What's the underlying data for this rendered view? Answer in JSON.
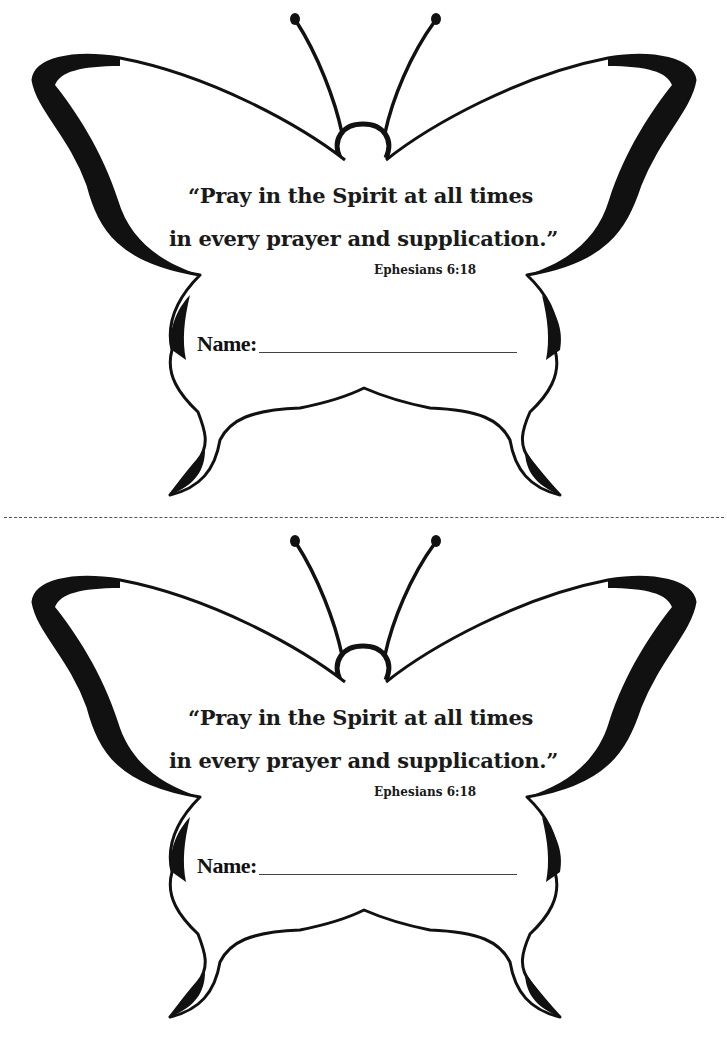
{
  "cards": [
    {
      "quote_line1": "“Pray in the Spirit at all times",
      "quote_line2": "in every prayer and supplication.”",
      "reference": "Ephesians 6:18",
      "name_label": "Name:",
      "name_value": ""
    },
    {
      "quote_line1": "“Pray in the Spirit at all times",
      "quote_line2": "in every prayer and supplication.”",
      "reference": "Ephesians 6:18",
      "name_label": "Name:",
      "name_value": ""
    }
  ],
  "cut_line": "dashed",
  "colors": {
    "ink": "#111111",
    "paper": "#ffffff"
  }
}
